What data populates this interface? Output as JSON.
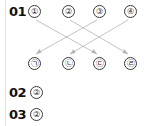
{
  "page": {
    "background_color": "#ffffff",
    "rule_color": "#e2e2e2",
    "line_color": "#b3b3b3",
    "text_color": "#1a1a1a"
  },
  "items": [
    {
      "number": "01",
      "type": "matching-diagram",
      "top_row": [
        {
          "label": "①",
          "name": "circled-1"
        },
        {
          "label": "②",
          "name": "circled-2"
        },
        {
          "label": "③",
          "name": "circled-3"
        },
        {
          "label": "④",
          "name": "circled-4"
        }
      ],
      "bottom_row": [
        {
          "label": "㉠",
          "name": "circled-giyeok"
        },
        {
          "label": "㉡",
          "name": "circled-nieun"
        },
        {
          "label": "㉢",
          "name": "circled-digeut"
        },
        {
          "label": "㉣",
          "name": "circled-rieul"
        }
      ],
      "connections": [
        {
          "from": "①",
          "to": "㉢"
        },
        {
          "from": "②",
          "to": "㉣"
        },
        {
          "from": "③",
          "to": "㉠"
        },
        {
          "from": "④",
          "to": "㉡"
        }
      ]
    },
    {
      "number": "02",
      "type": "answer",
      "answer": "②"
    },
    {
      "number": "03",
      "type": "answer",
      "answer": "②"
    }
  ]
}
